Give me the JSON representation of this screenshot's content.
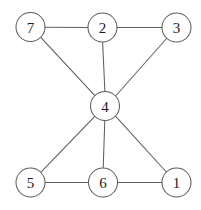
{
  "figure": {
    "background_color": "#ffffff",
    "edge_color": "#5e5e5e",
    "node_fill_color": "#ffffff",
    "node_stroke_color": "#5e5e5e",
    "label_color": "#1d1d1d",
    "node_radius": 14.5,
    "width": 201,
    "height": 210
  },
  "chart_data": {
    "type": "diagram",
    "diagram_type": "undirected-graph",
    "title": "",
    "directed": false,
    "weighted": false,
    "node_count": 7,
    "edge_count": 10,
    "nodes": [
      {
        "id": "7",
        "label": "7",
        "x": 30.5,
        "y": 27.0,
        "r": 14.5,
        "degree": 2
      },
      {
        "id": "2",
        "label": "2",
        "x": 102.5,
        "y": 27.5,
        "r": 14.5,
        "degree": 3
      },
      {
        "id": "3",
        "label": "3",
        "x": 176.5,
        "y": 27.5,
        "r": 14.5,
        "degree": 2
      },
      {
        "id": "4",
        "label": "4",
        "x": 105.0,
        "y": 106.0,
        "r": 14.5,
        "degree": 6
      },
      {
        "id": "5",
        "label": "5",
        "x": 30.5,
        "y": 182.5,
        "r": 14.5,
        "degree": 2
      },
      {
        "id": "6",
        "label": "6",
        "x": 103.0,
        "y": 182.5,
        "r": 14.5,
        "degree": 3
      },
      {
        "id": "1",
        "label": "1",
        "x": 176.5,
        "y": 182.5,
        "r": 14.5,
        "degree": 2
      }
    ],
    "edges": [
      {
        "source": "7",
        "target": "2",
        "x1": 45.0,
        "y1": 27.2,
        "x2": 88.0,
        "y2": 27.4
      },
      {
        "source": "2",
        "target": "3",
        "x1": 117.0,
        "y1": 27.5,
        "x2": 162.0,
        "y2": 27.5
      },
      {
        "source": "7",
        "target": "4",
        "x1": 41.0,
        "y1": 37.6,
        "x2": 94.9,
        "y2": 95.7
      },
      {
        "source": "2",
        "target": "4",
        "x1": 102.6,
        "y1": 42.0,
        "x2": 104.9,
        "y2": 91.5
      },
      {
        "source": "3",
        "target": "4",
        "x1": 166.6,
        "y1": 38.5,
        "x2": 115.6,
        "y2": 96.0
      },
      {
        "source": "4",
        "target": "5",
        "x1": 94.8,
        "y1": 116.4,
        "x2": 41.0,
        "y2": 172.2
      },
      {
        "source": "4",
        "target": "6",
        "x1": 104.8,
        "y1": 120.5,
        "x2": 103.2,
        "y2": 168.0
      },
      {
        "source": "4",
        "target": "1",
        "x1": 115.5,
        "y1": 116.2,
        "x2": 166.3,
        "y2": 172.0
      },
      {
        "source": "5",
        "target": "6",
        "x1": 45.0,
        "y1": 182.5,
        "x2": 88.5,
        "y2": 182.5
      },
      {
        "source": "6",
        "target": "1",
        "x1": 117.5,
        "y1": 182.5,
        "x2": 162.0,
        "y2": 182.5
      }
    ],
    "adjacency": {
      "1": [
        "4",
        "6"
      ],
      "2": [
        "7",
        "3",
        "4"
      ],
      "3": [
        "2",
        "4"
      ],
      "4": [
        "7",
        "2",
        "3",
        "5",
        "6",
        "1"
      ],
      "5": [
        "4",
        "6"
      ],
      "6": [
        "4",
        "5",
        "1"
      ],
      "7": [
        "2",
        "4"
      ]
    }
  }
}
